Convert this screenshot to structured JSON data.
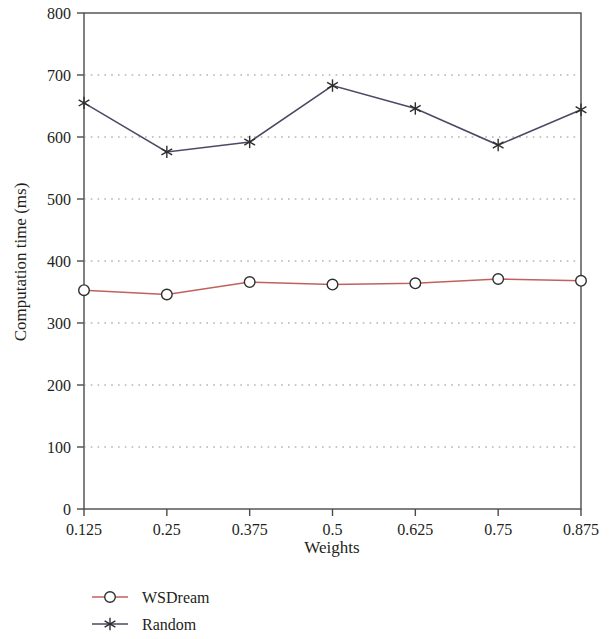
{
  "chart_data": {
    "type": "line",
    "title": "",
    "xlabel": "Weights",
    "ylabel": "Computation time (ms)",
    "categories": [
      "0.125",
      "0.25",
      "0.375",
      "0.5",
      "0.625",
      "0.75",
      "0.875"
    ],
    "x": [
      0.125,
      0.25,
      0.375,
      0.5,
      0.625,
      0.75,
      0.875
    ],
    "xlim": [
      0.125,
      0.875
    ],
    "ylim": [
      0,
      800
    ],
    "ytick_labels": [
      "0",
      "100",
      "200",
      "300",
      "400",
      "500",
      "600",
      "700",
      "800"
    ],
    "yticks": [
      0,
      100,
      200,
      300,
      400,
      500,
      600,
      700,
      800
    ],
    "xtick_labels": [
      "0.125",
      "0.25",
      "0.375",
      "0.5",
      "0.625",
      "0.75",
      "0.875"
    ],
    "grid": "horizontal-dotted",
    "legend_position": "bottom-left",
    "series": [
      {
        "name": "WSDream",
        "color": "#c0625c",
        "marker": "open-circle",
        "values": [
          353,
          346,
          366,
          362,
          364,
          371,
          368
        ]
      },
      {
        "name": "Random",
        "color": "#4a4a66",
        "marker": "asterisk",
        "values": [
          655,
          576,
          592,
          683,
          646,
          587,
          644
        ]
      }
    ]
  },
  "legend": {
    "items": [
      {
        "label": "WSDream",
        "color": "#c0625c",
        "marker": "open-circle"
      },
      {
        "label": "Random",
        "color": "#4a4a66",
        "marker": "asterisk"
      }
    ]
  }
}
